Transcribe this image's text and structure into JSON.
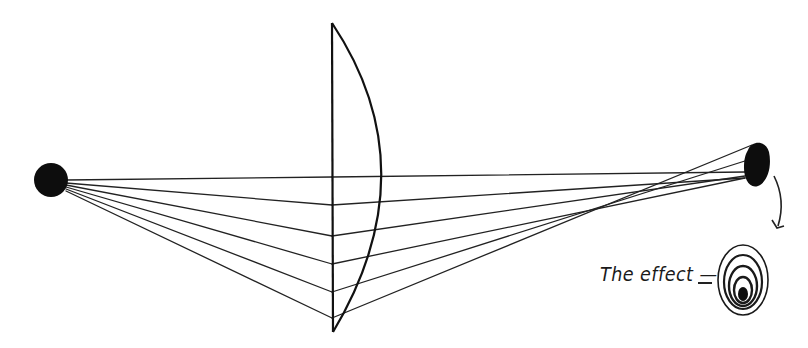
{
  "diagram": {
    "caption": "The effect —",
    "ink_color": "#111111",
    "background_color": "#ffffff",
    "source": {
      "label": "light-source",
      "cx": 51,
      "cy": 180,
      "r": 17
    },
    "lens": {
      "type": "plano-convex",
      "flat_x": 332,
      "top_y": 23,
      "bottom_y": 332,
      "bulge_x": 383
    },
    "image": {
      "label": "distorted-image",
      "cx": 757,
      "cy": 170
    },
    "effect_rings": 5
  }
}
